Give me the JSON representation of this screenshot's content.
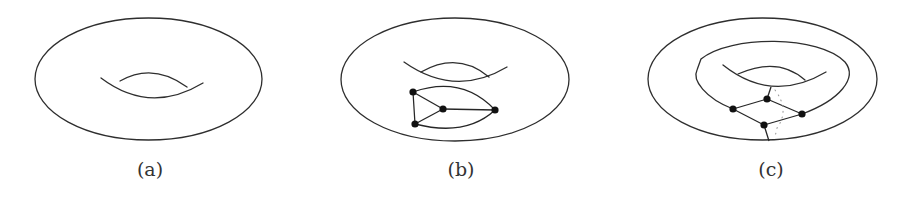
{
  "figure": {
    "panels": [
      {
        "id": "a",
        "label": "(a)",
        "description": "Torus",
        "nodes": [],
        "edges": []
      },
      {
        "id": "b",
        "label": "(b)",
        "description": "Torus with planar graph embedded (4 vertices) on the outer surface",
        "nodes": [
          {
            "id": "b1",
            "x": 413,
            "y": 92
          },
          {
            "id": "b2",
            "x": 443,
            "y": 109
          },
          {
            "id": "b3",
            "x": 495,
            "y": 110
          },
          {
            "id": "b4",
            "x": 415,
            "y": 124
          }
        ],
        "edges": [
          [
            "b1",
            "b4"
          ],
          [
            "b1",
            "b2"
          ],
          [
            "b4",
            "b2"
          ],
          [
            "b2",
            "b3"
          ],
          [
            "b1",
            "b3"
          ],
          [
            "b4",
            "b3"
          ]
        ]
      },
      {
        "id": "c",
        "label": "(c)",
        "description": "Torus with graph (4 vertices) wrapping around the handle; dotted back-side edge",
        "nodes": [
          {
            "id": "c1",
            "x": 733,
            "y": 109
          },
          {
            "id": "c2",
            "x": 767,
            "y": 99
          },
          {
            "id": "c3",
            "x": 802,
            "y": 114
          },
          {
            "id": "c4",
            "x": 764,
            "y": 125
          }
        ],
        "edges": [
          [
            "c1",
            "c2"
          ],
          [
            "c2",
            "c3"
          ],
          [
            "c1",
            "c4"
          ],
          [
            "c4",
            "c3"
          ]
        ]
      }
    ],
    "colors": {
      "line": "#2e2e2e",
      "node": "#111111",
      "dotted": "#9a9a9a",
      "background": "#ffffff"
    }
  }
}
